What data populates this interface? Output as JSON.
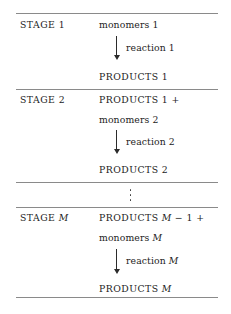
{
  "diagram": {
    "rule_color": "#8a8a8a",
    "text_color": "#1c1c1c",
    "arrow_color": "#2b2b2b"
  },
  "stages": [
    {
      "stage_label": "STAGE 1",
      "input": "monomers 1",
      "arrow_label": "reaction 1",
      "output": "PRODUCTS 1"
    },
    {
      "stage_label": "STAGE 2",
      "carry_in": "PRODUCTS 1 +",
      "input": "monomers 2",
      "arrow_label": "reaction 2",
      "output": "PRODUCTS 2"
    },
    {
      "ellipsis": "⋮"
    },
    {
      "stage_label_prefix": "STAGE",
      "stage_label_var": "M",
      "carry_in_prefix": "PRODUCTS",
      "carry_in_var": "M",
      "carry_in_suffix": "− 1 +",
      "input_prefix": "monomers",
      "input_var": "M",
      "arrow_label_prefix": "reaction",
      "arrow_label_var": "M",
      "output_prefix": "PRODUCTS",
      "output_var": "M"
    }
  ]
}
